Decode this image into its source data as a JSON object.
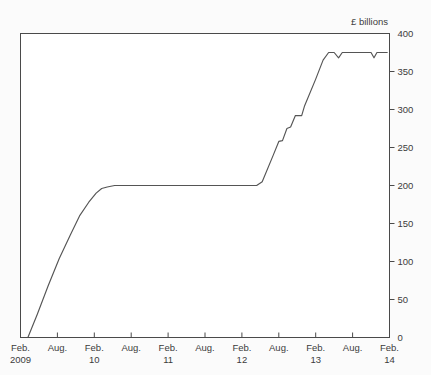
{
  "chart_data": {
    "type": "line",
    "title": "",
    "subtitle": "",
    "xlabel": "",
    "ylabel": "",
    "unit_label": "£ billions",
    "ylim": [
      0,
      400
    ],
    "yticks": [
      0,
      50,
      100,
      150,
      200,
      250,
      300,
      350,
      400
    ],
    "ytick_labels": [
      "0",
      "50",
      "100",
      "150",
      "200",
      "250",
      "300",
      "350",
      "400"
    ],
    "grid": false,
    "legend": null,
    "legend_position": "none",
    "y_axis_side": "right",
    "xtick_labels": [
      "Feb.",
      "Aug.",
      "Feb.",
      "Aug.",
      "Feb.",
      "Aug.",
      "Feb.",
      "Aug.",
      "Feb.",
      "Aug.",
      "Feb."
    ],
    "xyear_labels": [
      {
        "label": "2009",
        "tick_index": 0
      },
      {
        "label": "10",
        "tick_index": 2
      },
      {
        "label": "11",
        "tick_index": 4
      },
      {
        "label": "12",
        "tick_index": 6
      },
      {
        "label": "13",
        "tick_index": 8
      },
      {
        "label": "14",
        "tick_index": 10
      }
    ],
    "xlim": [
      0,
      10
    ],
    "series": [
      {
        "name": "Cumulative asset purchases",
        "color": "#555555",
        "points": [
          {
            "x": 0.2,
            "y": 0
          },
          {
            "x": 0.45,
            "y": 30
          },
          {
            "x": 0.75,
            "y": 68
          },
          {
            "x": 1.05,
            "y": 104
          },
          {
            "x": 1.35,
            "y": 135
          },
          {
            "x": 1.6,
            "y": 160
          },
          {
            "x": 1.85,
            "y": 178
          },
          {
            "x": 2.05,
            "y": 190
          },
          {
            "x": 2.2,
            "y": 196
          },
          {
            "x": 2.35,
            "y": 198
          },
          {
            "x": 2.55,
            "y": 200
          },
          {
            "x": 3.0,
            "y": 200
          },
          {
            "x": 4.0,
            "y": 200
          },
          {
            "x": 5.0,
            "y": 200
          },
          {
            "x": 6.0,
            "y": 200
          },
          {
            "x": 6.4,
            "y": 200
          },
          {
            "x": 6.55,
            "y": 205
          },
          {
            "x": 6.85,
            "y": 240
          },
          {
            "x": 7.0,
            "y": 258
          },
          {
            "x": 7.1,
            "y": 259
          },
          {
            "x": 7.22,
            "y": 275
          },
          {
            "x": 7.32,
            "y": 277
          },
          {
            "x": 7.45,
            "y": 292
          },
          {
            "x": 7.62,
            "y": 292
          },
          {
            "x": 7.7,
            "y": 305
          },
          {
            "x": 8.0,
            "y": 340
          },
          {
            "x": 8.2,
            "y": 365
          },
          {
            "x": 8.35,
            "y": 375
          },
          {
            "x": 8.5,
            "y": 375
          },
          {
            "x": 8.62,
            "y": 368
          },
          {
            "x": 8.72,
            "y": 375
          },
          {
            "x": 9.5,
            "y": 375
          },
          {
            "x": 9.58,
            "y": 368
          },
          {
            "x": 9.66,
            "y": 375
          },
          {
            "x": 9.95,
            "y": 375
          }
        ]
      }
    ]
  }
}
